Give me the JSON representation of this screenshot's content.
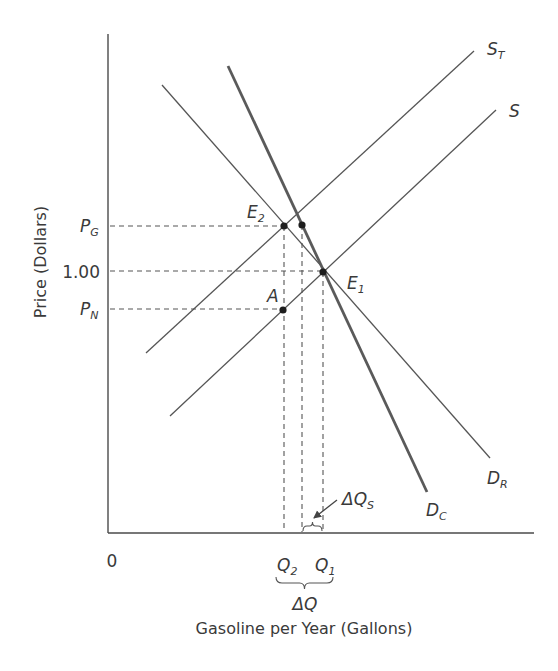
{
  "diagram": {
    "axes": {
      "origin_label": "0",
      "y_title": "Price (Dollars)",
      "x_title": "Gasoline per Year (Gallons)",
      "origin": [
        108,
        533
      ],
      "y_top": 34,
      "x_right": 534
    },
    "y_ticks": [
      {
        "id": "pg",
        "main": "P",
        "sub": "G",
        "y": 226
      },
      {
        "id": "one",
        "main": "1.00",
        "sub": "",
        "y": 271
      },
      {
        "id": "pn",
        "main": "P",
        "sub": "N",
        "y": 309
      }
    ],
    "x_ticks": [
      {
        "id": "q2",
        "main": "Q",
        "sub": "2",
        "x": 285
      },
      {
        "id": "q1",
        "main": "Q",
        "sub": "1",
        "x": 323
      }
    ],
    "curves": [
      {
        "id": "st",
        "main": "S",
        "sub": "T",
        "x1": 146,
        "y1": 353,
        "x2": 474,
        "y2": 51,
        "thick": false,
        "label_x": 487,
        "label_y": 55
      },
      {
        "id": "s",
        "main": "S",
        "sub": "",
        "x1": 170,
        "y1": 416,
        "x2": 496,
        "y2": 110,
        "thick": false,
        "label_x": 509,
        "label_y": 117
      },
      {
        "id": "dr",
        "main": "D",
        "sub": "R",
        "x1": 162,
        "y1": 85,
        "x2": 490,
        "y2": 458,
        "thick": false,
        "label_x": 487,
        "label_y": 484
      },
      {
        "id": "dc",
        "main": "D",
        "sub": "C",
        "x1": 228,
        "y1": 66,
        "x2": 427,
        "y2": 492,
        "thick": true,
        "label_x": 426,
        "label_y": 516
      }
    ],
    "points": [
      {
        "id": "e2",
        "main": "E",
        "sub": "2",
        "x": 284,
        "y": 226,
        "label_x": 247,
        "label_y": 218
      },
      {
        "id": "dot-dc",
        "main": "",
        "sub": "",
        "x": 302,
        "y": 225,
        "label_x": 0,
        "label_y": 0
      },
      {
        "id": "e1",
        "main": "E",
        "sub": "1",
        "x": 323,
        "y": 272,
        "label_x": 347,
        "label_y": 289
      },
      {
        "id": "a",
        "main": "A",
        "sub": "",
        "x": 283,
        "y": 310,
        "label_x": 267,
        "label_y": 302
      }
    ],
    "guides": {
      "horizontal": [
        {
          "y": 226,
          "x1": 110,
          "x2": 284
        },
        {
          "y": 271,
          "x1": 110,
          "x2": 323
        },
        {
          "y": 309,
          "x1": 110,
          "x2": 283
        }
      ],
      "vertical": [
        {
          "x": 284,
          "y1": 226,
          "y2": 532
        },
        {
          "x": 302,
          "y1": 225,
          "y2": 532
        },
        {
          "x": 323,
          "y1": 272,
          "y2": 532
        }
      ]
    },
    "annotations": {
      "delta_qs": {
        "main": "ΔQ",
        "sub": "S",
        "label_x": 342,
        "label_y": 505,
        "arrow": [
          337,
          500,
          314,
          518
        ],
        "brace_x1": 303,
        "brace_x2": 322,
        "brace_y": 526
      },
      "delta_q": {
        "main": "ΔQ",
        "label_x": 305,
        "label_y": 610,
        "brace_x1": 276,
        "brace_x2": 333,
        "brace_y": 583
      }
    },
    "colors": {
      "line": "#555555",
      "dot": "#1e1e1e",
      "text": "#3a3a3a",
      "background": "#ffffff"
    }
  }
}
